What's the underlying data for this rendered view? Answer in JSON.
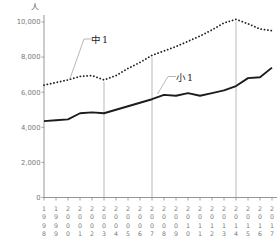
{
  "chart": {
    "unit_label": "人",
    "series_label_chu1": "中1",
    "series_label_sho1": "小1"
  },
  "chart_data": {
    "type": "line",
    "x": [
      1998,
      1999,
      2000,
      2001,
      2002,
      2003,
      2004,
      2005,
      2006,
      2007,
      2008,
      2009,
      2010,
      2011,
      2012,
      2013,
      2014,
      2015,
      2016,
      2017
    ],
    "series": [
      {
        "name": "中1",
        "style": "dotted",
        "values": [
          6400,
          6550,
          6700,
          6900,
          6950,
          6700,
          6950,
          7350,
          7700,
          8100,
          8350,
          8600,
          8900,
          9200,
          9550,
          9950,
          10150,
          9900,
          9600,
          9500
        ]
      },
      {
        "name": "小1",
        "style": "solid",
        "values": [
          4350,
          4400,
          4450,
          4800,
          4850,
          4800,
          5000,
          5200,
          5400,
          5600,
          5850,
          5800,
          5950,
          5800,
          5950,
          6100,
          6350,
          6800,
          6850,
          7400
        ]
      }
    ],
    "title": "",
    "xlabel": "",
    "ylabel": "人",
    "ylim": [
      0,
      10000
    ],
    "ytick_interval": 2000,
    "ytick_labels": [
      "0",
      "2,000",
      "4,000",
      "6,000",
      "8,000",
      "10,000"
    ],
    "gridline_years": [
      2003,
      2007,
      2014
    ],
    "grid": "vertical-reference-lines-to-dotted-series",
    "legend_position": "inline-annotations",
    "line_color": "#1c1c1c",
    "axis_color": "#8a8a8a",
    "tick_label_color": "#7a7a7a",
    "gridline_color": "#9b9b9b"
  }
}
